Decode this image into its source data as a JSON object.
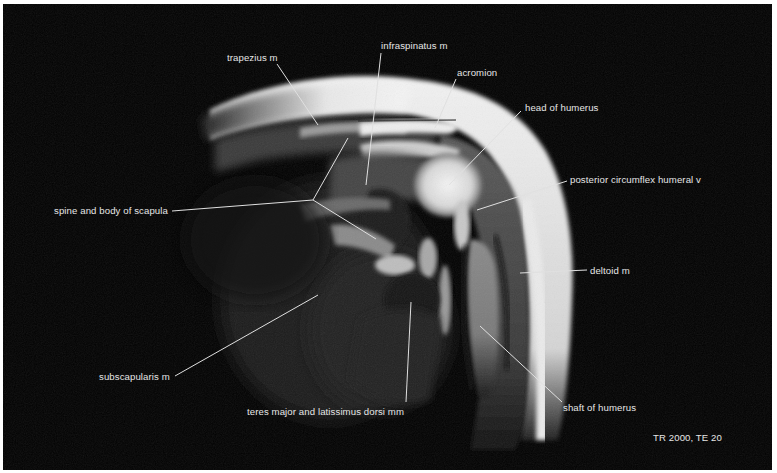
{
  "figure": {
    "labels": [
      {
        "id": "trapezius",
        "text": "trapezius m",
        "x": 227,
        "y": 52,
        "line": [
          [
            277,
            64
          ],
          [
            318,
            125
          ]
        ]
      },
      {
        "id": "infraspinatus",
        "text": "infraspinatus m",
        "x": 381,
        "y": 40,
        "line": [
          [
            381,
            53
          ],
          [
            366,
            185
          ]
        ]
      },
      {
        "id": "acromion",
        "text": "acromion",
        "x": 457,
        "y": 67,
        "line": [
          [
            456,
            79
          ],
          [
            435,
            128
          ]
        ]
      },
      {
        "id": "head-of-humerus",
        "text": "head of humerus",
        "x": 525,
        "y": 102,
        "line": [
          [
            521,
            111
          ],
          [
            449,
            185
          ]
        ]
      },
      {
        "id": "posterior-circumflex",
        "text": "posterior circumflex humeral v",
        "x": 570,
        "y": 174,
        "line": [
          [
            567,
            181
          ],
          [
            477,
            210
          ]
        ]
      },
      {
        "id": "spine-scapula",
        "text": "spine and body of scapula",
        "x": 54,
        "y": 205,
        "line": [
          [
            172,
            211
          ],
          [
            313,
            200
          ]
        ],
        "branches": [
          [
            [
              313,
              200
            ],
            [
              348,
              138
            ]
          ],
          [
            [
              313,
              200
            ],
            [
              376,
              239
            ]
          ]
        ]
      },
      {
        "id": "deltoid",
        "text": "deltoid m",
        "x": 590,
        "y": 265,
        "line": [
          [
            587,
            270
          ],
          [
            520,
            273
          ]
        ]
      },
      {
        "id": "subscapularis",
        "text": "subscapularis m",
        "x": 99,
        "y": 371,
        "line": [
          [
            175,
            376
          ],
          [
            318,
            295
          ]
        ]
      },
      {
        "id": "teres-latissimus",
        "text": "teres major and latissimus dorsi mm",
        "x": 247,
        "y": 406,
        "line": [
          [
            406,
            402
          ],
          [
            411,
            302
          ]
        ]
      },
      {
        "id": "shaft-humerus",
        "text": "shaft of humerus",
        "x": 563,
        "y": 402,
        "line": [
          [
            562,
            402
          ],
          [
            480,
            326
          ]
        ]
      }
    ],
    "sequence_params": {
      "text": "TR 2000, TE 20",
      "x": 653,
      "y": 432
    }
  }
}
